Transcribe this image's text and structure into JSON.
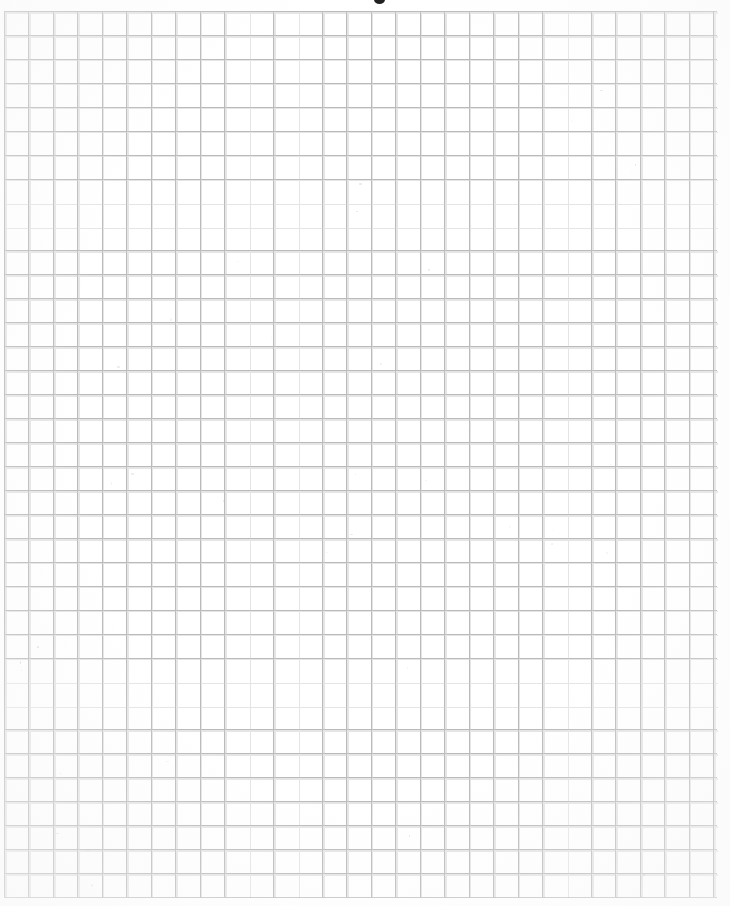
{
  "document": {
    "kind": "scanned-grid-paper",
    "title": "",
    "body_text": "",
    "page_background_color": "#ffffff",
    "grid": {
      "line_color": "#a0a0a0",
      "line_color_light": "#c6c6c6",
      "cell_width_px": 24.46,
      "cell_height_px": 23.95,
      "columns": 29,
      "rows": 37,
      "origin_x_px": 4,
      "origin_y_px": 11,
      "width_px": 713,
      "height_px": 886,
      "line_width_px": 1
    },
    "marks": [
      {
        "name": "top-cropped-glyph",
        "description": "partial dark glyph cut off by the top edge of the scan",
        "x_px": 374,
        "y_px": 0,
        "width_px": 11,
        "height_px": 4,
        "color": "#1a1a1a"
      }
    ],
    "margins": {
      "top_px": 11,
      "left_px": 4,
      "right_px": 13,
      "bottom_px": 9
    }
  }
}
